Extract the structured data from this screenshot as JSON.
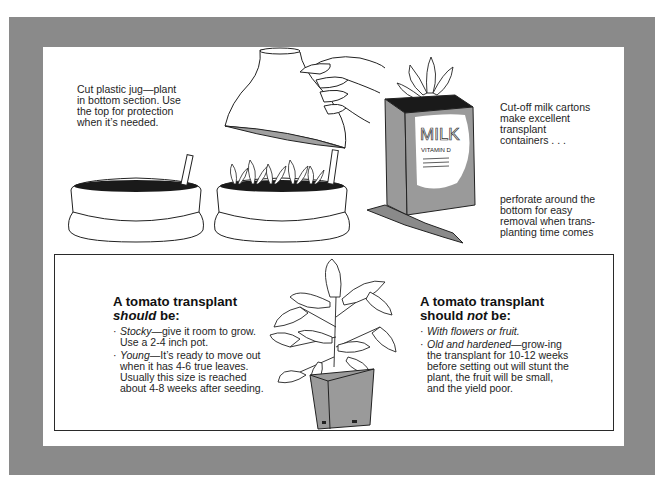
{
  "top_section": {
    "jug_caption": "Cut plastic jug—plant\nin bottom section. Use\nthe top for protection\nwhen it’s needed.",
    "carton_caption": "Cut-off milk cartons\nmake excellent\ntransplant\ncontainers . . .",
    "perforate_caption": "perforate around the\nbottom for easy\nremoval when trans-\nplanting time comes",
    "carton_label_main": "MILK",
    "carton_label_sub": "VITAMIN D"
  },
  "should_box": {
    "heading_line1": "A tomato transplant",
    "heading_em": "should",
    "heading_rest": " be:",
    "items": [
      {
        "term": "Stocky",
        "text": "—give it room to grow. Use a 2-4 inch pot."
      },
      {
        "term": "Young",
        "text": "—It’s ready to move out when it has 4-6 true leaves. Usually this size is reached about 4-8 weeks after seeding."
      }
    ]
  },
  "should_not_box": {
    "heading_line1": "A tomato transplant",
    "heading_pre": "should ",
    "heading_em": "not",
    "heading_rest": " be:",
    "items": [
      {
        "term": "With flowers or fruit.",
        "text": ""
      },
      {
        "term": "Old and hardened",
        "text": "—grow-ing the transplant for 10-12 weeks before setting out will stunt the plant, the fruit will be small, and the yield poor."
      }
    ]
  },
  "colors": {
    "frame_gray": "#8a8a8a",
    "carton_gray": "#9a9a9a",
    "soil": "#1a1a1a",
    "line": "#222222"
  }
}
